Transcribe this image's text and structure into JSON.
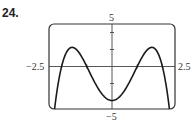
{
  "problem": {
    "number": "24."
  },
  "chart_data": {
    "type": "line",
    "title": "",
    "xlabel": "",
    "ylabel": "",
    "xlim": [
      -2.5,
      2.5
    ],
    "ylim": [
      -5,
      5
    ],
    "x_tick_labels": {
      "min": "−2.5",
      "max": "2.5"
    },
    "y_tick_labels": {
      "max": "5",
      "min": "−5"
    },
    "x_ticks": [
      -2,
      -1,
      1,
      2
    ],
    "y_ticks": [
      -4,
      -2,
      2,
      4
    ],
    "grid": false,
    "frame": "rounded-rectangle",
    "series": [
      {
        "name": "f(x) = -(x^2 - 1)(x^2 - 4)",
        "description": "quartic with zeros at -2, -1, 1, 2; local maxima near x=±1.58, local minimum at (0, -4)",
        "points": [
          [
            -2.3,
            -5.5
          ],
          [
            -2.2,
            -3.27
          ],
          [
            -2.0,
            0
          ],
          [
            -1.8,
            1.98
          ],
          [
            -1.6,
            2.25
          ],
          [
            -1.4,
            1.95
          ],
          [
            -1.2,
            1.17
          ],
          [
            -1.0,
            0
          ],
          [
            -0.8,
            -1.32
          ],
          [
            -0.5,
            -2.81
          ],
          [
            0,
            -4
          ],
          [
            0.5,
            -2.81
          ],
          [
            0.8,
            -1.32
          ],
          [
            1.0,
            0
          ],
          [
            1.2,
            1.17
          ],
          [
            1.4,
            1.95
          ],
          [
            1.6,
            2.25
          ],
          [
            1.8,
            1.98
          ],
          [
            2.0,
            0
          ],
          [
            2.2,
            -3.27
          ],
          [
            2.3,
            -5.5
          ]
        ]
      }
    ],
    "colors": {
      "curve": "#1a1a1a",
      "axes": "#333333",
      "frame": "#333333"
    }
  }
}
